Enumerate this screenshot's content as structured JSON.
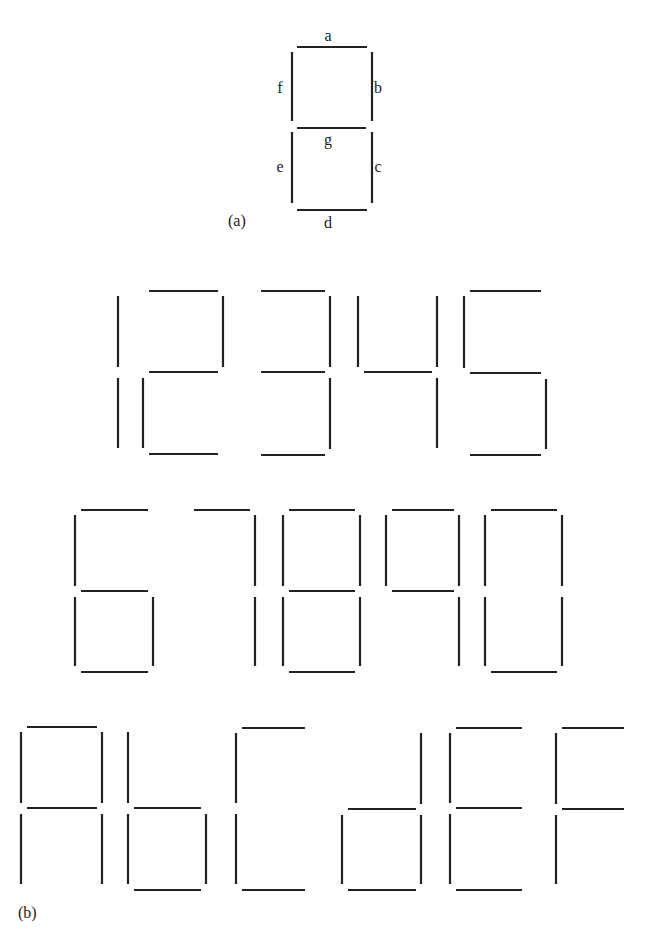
{
  "figure": {
    "part_a": {
      "label": "(a)",
      "label_pos": [
        228,
        226
      ],
      "segment_labels": [
        {
          "name": "a",
          "x": 328,
          "y": 41
        },
        {
          "name": "b",
          "x": 378,
          "y": 93
        },
        {
          "name": "c",
          "x": 378,
          "y": 172
        },
        {
          "name": "d",
          "x": 328,
          "y": 228
        },
        {
          "name": "e",
          "x": 280,
          "y": 172
        },
        {
          "name": "f",
          "x": 280,
          "y": 93
        },
        {
          "name": "g",
          "x": 328,
          "y": 145
        }
      ],
      "segments": [
        {
          "id": "a",
          "x1": 297,
          "y1": 47,
          "x2": 367,
          "y2": 47
        },
        {
          "id": "b",
          "x1": 372,
          "y1": 52,
          "x2": 372,
          "y2": 121
        },
        {
          "id": "c",
          "x1": 372,
          "y1": 132,
          "x2": 372,
          "y2": 203
        },
        {
          "id": "d",
          "x1": 297,
          "y1": 210,
          "x2": 367,
          "y2": 210
        },
        {
          "id": "e",
          "x1": 292,
          "y1": 132,
          "x2": 292,
          "y2": 203
        },
        {
          "id": "f",
          "x1": 292,
          "y1": 52,
          "x2": 292,
          "y2": 121
        },
        {
          "id": "g",
          "x1": 297,
          "y1": 128,
          "x2": 366,
          "y2": 128
        }
      ]
    },
    "part_b": {
      "label": "(b)",
      "label_pos": [
        18,
        918
      ],
      "rows": [
        {
          "glyphs": [
            {
              "char": "1",
              "lit": [
                "b",
                "c"
              ],
              "left": 118,
              "right": 118,
              "top": 291,
              "mid": 372,
              "bottom": 454
            },
            {
              "char": "2",
              "lit": [
                "a",
                "b",
                "g",
                "e",
                "d"
              ],
              "left": 143,
              "right": 223,
              "top": 291,
              "mid": 372,
              "bottom": 454
            },
            {
              "char": "3",
              "lit": [
                "a",
                "b",
                "g",
                "c",
                "d"
              ],
              "left": 255,
              "right": 330,
              "top": 291,
              "mid": 372,
              "bottom": 455
            },
            {
              "char": "4",
              "lit": [
                "f",
                "b",
                "g",
                "c"
              ],
              "left": 358,
              "right": 437,
              "top": 291,
              "mid": 372,
              "bottom": 454
            },
            {
              "char": "5",
              "lit": [
                "a",
                "f",
                "g",
                "c",
                "d"
              ],
              "left": 464,
              "right": 546,
              "top": 291,
              "mid": 373,
              "bottom": 455
            }
          ]
        },
        {
          "glyphs": [
            {
              "char": "6",
              "lit": [
                "a",
                "f",
                "g",
                "e",
                "c",
                "d"
              ],
              "left": 75,
              "right": 153,
              "top": 510,
              "mid": 591,
              "bottom": 672
            },
            {
              "char": "7",
              "lit": [
                "a",
                "b",
                "c"
              ],
              "left": 188,
              "right": 255,
              "top": 510,
              "mid": 591,
              "bottom": 672
            },
            {
              "char": "8",
              "lit": [
                "a",
                "b",
                "c",
                "d",
                "e",
                "f",
                "g"
              ],
              "left": 283,
              "right": 360,
              "top": 510,
              "mid": 591,
              "bottom": 672
            },
            {
              "char": "9",
              "lit": [
                "a",
                "b",
                "c",
                "f",
                "g"
              ],
              "left": 386,
              "right": 459,
              "top": 510,
              "mid": 591,
              "bottom": 672
            },
            {
              "char": "0",
              "lit": [
                "a",
                "b",
                "c",
                "d",
                "e",
                "f"
              ],
              "left": 485,
              "right": 562,
              "top": 510,
              "mid": 591,
              "bottom": 672
            }
          ]
        },
        {
          "glyphs": [
            {
              "char": "A",
              "lit": [
                "a",
                "b",
                "c",
                "e",
                "f",
                "g"
              ],
              "left": 21,
              "right": 102,
              "top": 727,
              "mid": 808,
              "bottom": 890
            },
            {
              "char": "b",
              "lit": [
                "c",
                "d",
                "e",
                "f",
                "g"
              ],
              "left": 128,
              "right": 206,
              "top": 727,
              "mid": 808,
              "bottom": 890
            },
            {
              "char": "C",
              "lit": [
                "a",
                "d",
                "e",
                "f"
              ],
              "left": 236,
              "right": 310,
              "top": 728,
              "mid": 808,
              "bottom": 890
            },
            {
              "char": "d",
              "lit": [
                "b",
                "c",
                "d",
                "e",
                "g"
              ],
              "left": 342,
              "right": 421,
              "top": 728,
              "mid": 809,
              "bottom": 890
            },
            {
              "char": "E",
              "lit": [
                "a",
                "d",
                "e",
                "f",
                "g"
              ],
              "left": 450,
              "right": 527,
              "top": 728,
              "mid": 808,
              "bottom": 890
            },
            {
              "char": "F",
              "lit": [
                "a",
                "e",
                "f",
                "g"
              ],
              "left": 556,
              "right": 629,
              "top": 728,
              "mid": 809,
              "bottom": 890
            }
          ]
        }
      ]
    },
    "colors": {
      "ink": "#222222",
      "background": "#ffffff"
    }
  }
}
